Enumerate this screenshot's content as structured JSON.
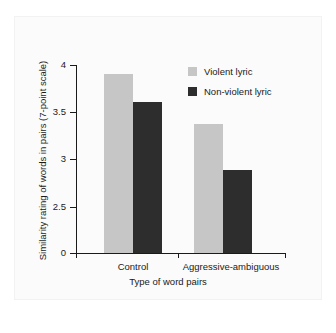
{
  "chart_data": {
    "type": "bar",
    "title": "",
    "subtitle": "",
    "xlabel": "Type of word pairs",
    "ylabel": "Similarity rating of words in pairs (7-point scale)",
    "categories": [
      "Control",
      "Aggressive-ambiguous"
    ],
    "series": [
      {
        "name": "Violent lyric",
        "color": "#c6c6c6",
        "values": [
          3.91,
          3.39
        ]
      },
      {
        "name": "Non-violent lyric",
        "color": "#2d2d2d",
        "values": [
          3.62,
          2.9
        ]
      }
    ],
    "ylim": [
      2.35,
      4.0
    ],
    "ytick_labels": [
      "0",
      "2.5",
      "3",
      "3.5",
      "4"
    ],
    "ytick_values": [
      0,
      2.5,
      3,
      3.5,
      4
    ],
    "axis_break": true,
    "grid": false,
    "legend_position": "top-right"
  },
  "legend": {
    "entries": [
      {
        "label": "Violent lyric",
        "color": "#c6c6c6"
      },
      {
        "label": "Non-violent lyric",
        "color": "#2d2d2d"
      }
    ]
  },
  "axes": {
    "y_ticks": [
      {
        "label": "4",
        "top": 65
      },
      {
        "label": "3.5",
        "top": 112
      },
      {
        "label": "3",
        "top": 159
      },
      {
        "label": "2.5",
        "top": 207
      },
      {
        "label": "0",
        "top": 253
      }
    ],
    "x_groups": [
      {
        "label": "Control",
        "center": 133
      },
      {
        "label": "Aggressive-ambiguous",
        "center": 231
      }
    ]
  },
  "bars": [
    {
      "name": "control-violent",
      "series": "Violent lyric",
      "category": "Control",
      "value": 3.91,
      "left": 104,
      "top": 74,
      "width": 29,
      "height": 179
    },
    {
      "name": "control-nonviolent",
      "series": "Non-violent lyric",
      "category": "Control",
      "value": 3.62,
      "left": 133,
      "top": 102,
      "width": 29,
      "height": 151
    },
    {
      "name": "aggressive-ambiguous-violent",
      "series": "Violent lyric",
      "category": "Aggressive-ambiguous",
      "value": 3.39,
      "left": 194,
      "top": 124,
      "width": 29,
      "height": 129
    },
    {
      "name": "aggressive-ambiguous-nonviolent",
      "series": "Non-violent lyric",
      "category": "Aggressive-ambiguous",
      "value": 2.9,
      "left": 223,
      "top": 170,
      "width": 29,
      "height": 83
    }
  ]
}
